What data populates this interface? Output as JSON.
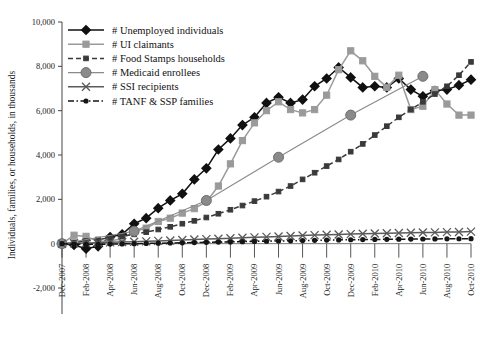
{
  "chart_data": {
    "type": "line",
    "title": "",
    "subtitle": "",
    "xlabel": "",
    "ylabel": "Individuals, families, or households, in thousands",
    "ylim": [
      -2000,
      10000
    ],
    "yticks": [
      -2000,
      0,
      2000,
      4000,
      6000,
      8000,
      10000
    ],
    "ytick_labels": [
      "-2,000",
      "0",
      "2,000",
      "4,000",
      "6,000",
      "8,000",
      "10,000"
    ],
    "grid": false,
    "legend_position": "top-left",
    "categories": [
      "Dec-2007",
      "Jan-2008",
      "Feb-2008",
      "Mar-2008",
      "Apr-2008",
      "May-2008",
      "Jun-2008",
      "Jul-2008",
      "Aug-2008",
      "Sep-2008",
      "Oct-2008",
      "Nov-2008",
      "Dec-2008",
      "Jan-2009",
      "Feb-2009",
      "Mar-2009",
      "Apr-2009",
      "May-2009",
      "Jun-2009",
      "Jul-2009",
      "Aug-2009",
      "Sep-2009",
      "Oct-2009",
      "Nov-2009",
      "Dec-2009",
      "Jan-2010",
      "Feb-2010",
      "Mar-2010",
      "Apr-2010",
      "May-2010",
      "Jun-2010",
      "Jul-2010",
      "Aug-2010",
      "Sep-2010",
      "Oct-2010"
    ],
    "xtick_labels": [
      "Dec-2007",
      "Feb-2008",
      "Apr-2008",
      "Jun-2008",
      "Aug-2008",
      "Oct-2008",
      "Dec-2008",
      "Feb-2009",
      "Apr-2009",
      "Jun-2009",
      "Aug-2009",
      "Oct-2009",
      "Dec-2009",
      "Feb-2010",
      "Apr-2010",
      "Jun-2010",
      "Aug-2010",
      "Oct-2010"
    ],
    "series": [
      {
        "name": "# Unemployed individuals",
        "color": "#111111",
        "marker": "diamond",
        "line": "solid",
        "values": [
          0,
          -60,
          -230,
          -120,
          300,
          420,
          900,
          1150,
          1600,
          1950,
          2250,
          2900,
          3400,
          4250,
          4750,
          5350,
          5700,
          6350,
          6600,
          6350,
          6500,
          7100,
          7450,
          7950,
          7500,
          7050,
          7100,
          7050,
          7450,
          6950,
          6650,
          6900,
          6950,
          7150,
          7400
        ]
      },
      {
        "name": "# UI claimants",
        "color": "#9a9a9a",
        "marker": "square",
        "line": "solid",
        "values": [
          0,
          380,
          330,
          100,
          120,
          220,
          560,
          700,
          1000,
          1150,
          1380,
          1580,
          1900,
          2600,
          3600,
          4650,
          5450,
          6000,
          6400,
          6050,
          5900,
          6050,
          6700,
          7850,
          8700,
          8250,
          7550,
          7050,
          7600,
          6050,
          6200,
          6950,
          6300,
          5800,
          5800
        ]
      },
      {
        "name": "# Food Stamps households",
        "color": "#3a3a3a",
        "marker": "small-square",
        "line": "dashed",
        "values": [
          0,
          60,
          120,
          190,
          260,
          340,
          420,
          520,
          640,
          760,
          900,
          1030,
          1180,
          1350,
          1530,
          1720,
          1920,
          2120,
          2350,
          2600,
          2900,
          3200,
          3500,
          3800,
          4150,
          4500,
          4900,
          5300,
          5700,
          6050,
          6400,
          6750,
          7100,
          7600,
          8200
        ]
      },
      {
        "name": "# Medicaid enrollees",
        "color": "#8a8a8a",
        "marker": "circle",
        "line": "solid",
        "sparse_points": [
          {
            "x": "Dec-2007",
            "y": 0
          },
          {
            "x": "Jun-2008",
            "y": 560
          },
          {
            "x": "Dec-2008",
            "y": 1950
          },
          {
            "x": "Jun-2009",
            "y": 3900
          },
          {
            "x": "Dec-2009",
            "y": 5800
          },
          {
            "x": "Jun-2010",
            "y": 7550
          }
        ]
      },
      {
        "name": "# SSI recipients",
        "color": "#5a5a5a",
        "marker": "x",
        "line": "solid",
        "values": [
          0,
          15,
          30,
          45,
          60,
          75,
          90,
          105,
          125,
          145,
          165,
          185,
          205,
          225,
          245,
          265,
          285,
          305,
          325,
          345,
          365,
          385,
          400,
          415,
          430,
          445,
          460,
          470,
          480,
          490,
          500,
          510,
          520,
          530,
          545
        ]
      },
      {
        "name": "# TANF & SSP families",
        "color": "#151515",
        "marker": "dot",
        "line": "dash-dot",
        "values": [
          0,
          -20,
          -35,
          -30,
          -20,
          -10,
          0,
          10,
          20,
          30,
          40,
          50,
          60,
          70,
          80,
          90,
          100,
          110,
          120,
          130,
          140,
          150,
          160,
          168,
          176,
          184,
          190,
          196,
          202,
          206,
          210,
          214,
          218,
          222,
          226
        ]
      }
    ]
  },
  "legend": {
    "items": [
      {
        "label": "# Unemployed individuals"
      },
      {
        "label": "# UI claimants"
      },
      {
        "label": "# Food Stamps households"
      },
      {
        "label": "# Medicaid enrollees"
      },
      {
        "label": "# SSI recipients"
      },
      {
        "label": "# TANF & SSP families"
      }
    ]
  }
}
